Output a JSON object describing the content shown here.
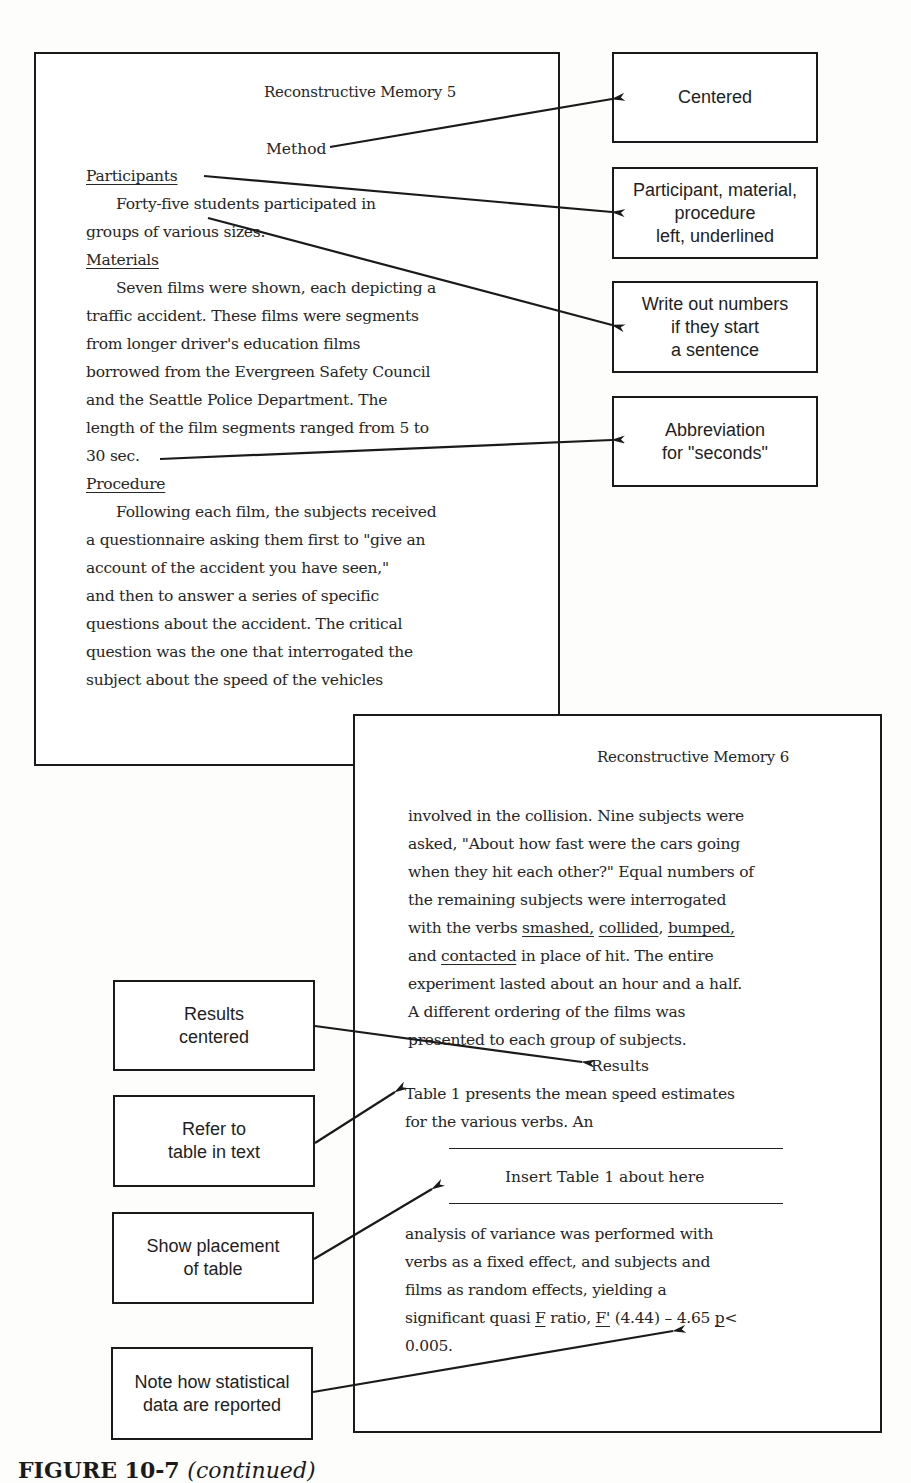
{
  "page1": {
    "running_head": "Reconstructive Memory  5",
    "section_heading": "Method",
    "participants_heading": "Participants",
    "participants_lines": [
      "Forty-five students participated in",
      "groups of various sizes."
    ],
    "materials_heading": "Materials",
    "materials_lines": [
      "Seven films were shown, each depicting a",
      "traffic accident. These films were segments",
      "from longer driver's education films",
      "borrowed from the Evergreen Safety Council",
      "and the Seattle Police Department. The",
      "length of the film segments ranged from 5 to",
      "30 sec."
    ],
    "procedure_heading": "Procedure",
    "procedure_lines": [
      "Following each film, the subjects received",
      "a questionnaire asking them first to \"give an",
      "account of the accident you have seen,\"",
      "and then to answer a series of specific",
      "questions about the accident. The critical",
      "question was the one that interrogated the",
      "subject about the speed of the vehicles"
    ]
  },
  "page2": {
    "running_head": "Reconstructive Memory  6",
    "method_lines": [
      "involved in the collision. Nine subjects were",
      "asked, \"About how fast were the cars going",
      "when they hit each other?\" Equal numbers of",
      "the remaining subjects were interrogated"
    ],
    "verbs_line": {
      "prefix": "with the verbs ",
      "verb1": "smashed,",
      "verb2": "collided",
      "sep": ", ",
      "verb3": "bumped,"
    },
    "contacted_line": {
      "prefix": "and ",
      "verb4": "contacted",
      "suffix": " in place of hit. The entire"
    },
    "method_lines_2": [
      "experiment lasted about an hour and a half.",
      "A different ordering of the films was",
      "presented to each group of subjects."
    ],
    "results_heading": "Results",
    "results_lines": [
      "Table 1 presents the mean speed estimates",
      "for the various verbs. An"
    ],
    "table_placeholder": "Insert Table 1 about here",
    "analysis_lines": [
      "analysis of variance was performed with",
      "verbs as a fixed effect, and subjects and",
      "films as random effects, yielding a"
    ],
    "stat_line": {
      "prefix": "significant quasi ",
      "f1": "F",
      "mid": " ratio, ",
      "f2": "F'",
      "values": " (4.44) – 4.65 ",
      "p": "p",
      "suffix": "<"
    },
    "stat_tail": "0.005."
  },
  "annotations": {
    "centered": [
      "Centered"
    ],
    "headings": [
      "Participant, material,",
      "procedure",
      "left, underlined"
    ],
    "numbers": [
      "Write out numbers",
      "if they start",
      "a sentence"
    ],
    "abbreviation": [
      "Abbreviation",
      "for \"seconds\""
    ],
    "results_centered": [
      "Results",
      "centered"
    ],
    "refer_table": [
      "Refer to",
      "table in text"
    ],
    "table_placement": [
      "Show placement",
      "of table"
    ],
    "statistics": [
      "Note how statistical",
      "data are reported"
    ]
  },
  "caption": {
    "label": "FIGURE 10-7",
    "suffix": "(continued)"
  }
}
